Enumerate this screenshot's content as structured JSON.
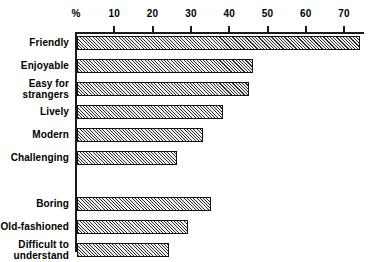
{
  "chart_data": {
    "type": "bar",
    "orientation": "horizontal",
    "title": "",
    "xlabel": "%",
    "ylabel": "",
    "xlim": [
      0,
      75
    ],
    "grid": false,
    "legend": null,
    "axis_unit_label": "%",
    "tick_labels": [
      "10",
      "20",
      "30",
      "40",
      "50",
      "60",
      "70"
    ],
    "tick_values": [
      10,
      20,
      30,
      40,
      50,
      60,
      70
    ],
    "categories": [
      "Friendly",
      "Enjoyable",
      "Easy for\nstrangers",
      "Lively",
      "Modern",
      "Challenging",
      "Boring",
      "Old-fashioned",
      "Difficult to\nunderstand"
    ],
    "values": [
      74,
      46,
      45,
      38,
      33,
      26,
      35,
      29,
      24
    ],
    "group_break_after_index": 5
  },
  "style": {
    "axis_color": "#1a1a1a",
    "bar_edge_color": "#111111",
    "bar_fill": "hatched-diagonal",
    "background": "#ffffff"
  }
}
